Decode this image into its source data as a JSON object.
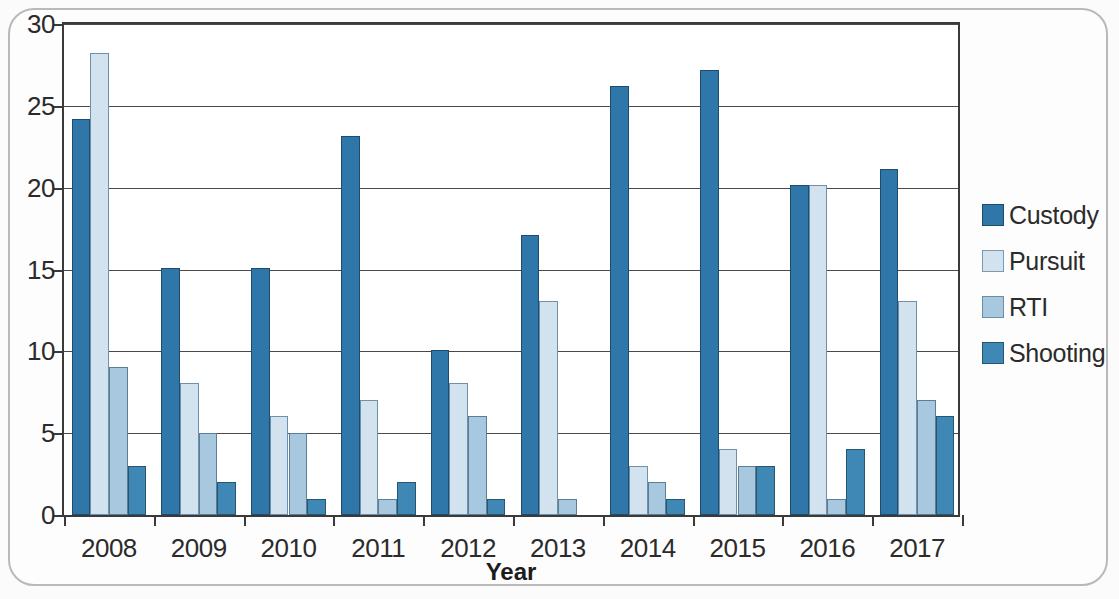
{
  "chart_data": {
    "type": "bar",
    "title": "",
    "subtitle": "",
    "xlabel": "Year",
    "ylabel": "",
    "categories": [
      "2008",
      "2009",
      "2010",
      "2011",
      "2012",
      "2013",
      "2014",
      "2015",
      "2016",
      "2017"
    ],
    "series": [
      {
        "name": "Custody",
        "color": "#2e77a8",
        "values": [
          24,
          15,
          15,
          23,
          10,
          17,
          26,
          27,
          20,
          21
        ]
      },
      {
        "name": "Pursuit",
        "color": "#d2e2ee",
        "values": [
          28,
          8,
          6,
          7,
          8,
          13,
          3,
          4,
          20,
          13
        ]
      },
      {
        "name": "RTI",
        "color": "#a7c8de",
        "values": [
          9,
          5,
          5,
          1,
          6,
          1,
          2,
          3,
          1,
          7
        ]
      },
      {
        "name": "Shooting",
        "color": "#3f87b4",
        "values": [
          3,
          2,
          1,
          2,
          1,
          0,
          1,
          3,
          4,
          6
        ]
      }
    ],
    "ylim": [
      0,
      30
    ],
    "yticks": [
      0,
      5,
      10,
      15,
      20,
      25,
      30
    ],
    "ytick_labels": [
      "0",
      "5",
      "10",
      "15",
      "20",
      "25",
      "30"
    ],
    "grid": true,
    "legend_position": "right",
    "legend_entries": [
      "Custody",
      "Pursuit",
      "RTI",
      "Shooting"
    ]
  }
}
